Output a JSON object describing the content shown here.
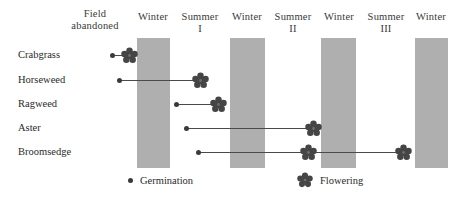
{
  "figure": {
    "background_color": "#ffffff",
    "winter_bar_color": "#a8a8a8",
    "marker_color": "#3a3a3a"
  },
  "columns": [
    {
      "label": "Field\nabandoned",
      "center_x": 95,
      "top": 8,
      "shaded": false
    },
    {
      "label": "Winter",
      "center_x": 153,
      "top": 11,
      "shaded": true
    },
    {
      "label": "Summer\nI",
      "center_x": 200,
      "top": 11,
      "shaded": false
    },
    {
      "label": "Winter",
      "center_x": 247,
      "top": 11,
      "shaded": true
    },
    {
      "label": "Summer\nII",
      "center_x": 293,
      "top": 11,
      "shaded": false
    },
    {
      "label": "Winter",
      "center_x": 339,
      "top": 11,
      "shaded": true
    },
    {
      "label": "Summer\nIII",
      "center_x": 386,
      "top": 11,
      "shaded": false
    },
    {
      "label": "Winter",
      "center_x": 431,
      "top": 11,
      "shaded": true
    }
  ],
  "winter_bars": [
    {
      "name": "winter-1",
      "x": 137,
      "y": 38,
      "width": 33,
      "height": 130
    },
    {
      "name": "winter-2",
      "x": 230,
      "y": 38,
      "width": 35,
      "height": 130
    },
    {
      "name": "winter-3",
      "x": 321,
      "y": 38,
      "width": 35,
      "height": 130
    },
    {
      "name": "winter-4",
      "x": 415,
      "y": 38,
      "width": 33,
      "height": 130
    }
  ],
  "rows": [
    {
      "species": "Crabgrass",
      "label_x": 18,
      "row_y": 55,
      "germination_x": 112,
      "flowering_x": [
        129
      ],
      "track_start": 112,
      "track_end": 129
    },
    {
      "species": "Horseweed",
      "label_x": 18,
      "row_y": 80,
      "germination_x": 119,
      "flowering_x": [
        200
      ],
      "track_start": 119,
      "track_end": 200
    },
    {
      "species": "Ragweed",
      "label_x": 18,
      "row_y": 104,
      "germination_x": 176,
      "flowering_x": [
        218
      ],
      "track_start": 176,
      "track_end": 218
    },
    {
      "species": "Aster",
      "label_x": 18,
      "row_y": 128,
      "germination_x": 186,
      "flowering_x": [
        313
      ],
      "track_start": 186,
      "track_end": 313
    },
    {
      "species": "Broomsedge",
      "label_x": 18,
      "row_y": 152,
      "germination_x": 198,
      "flowering_x": [
        308,
        403
      ],
      "track_start": 198,
      "track_end": 403
    }
  ],
  "legend": {
    "germination": {
      "label": "Germination",
      "x": 128,
      "y": 175
    },
    "flowering": {
      "label": "Flowering",
      "x": 297,
      "y": 172
    }
  },
  "chart_data": {
    "type": "table",
    "xlabel": "",
    "ylabel": "",
    "x_categories": [
      "Field abandoned",
      "Winter",
      "Summer I",
      "Winter",
      "Summer II",
      "Winter",
      "Summer III",
      "Winter"
    ],
    "categories": [
      "Crabgrass",
      "Horseweed",
      "Ragweed",
      "Aster",
      "Broomsedge"
    ],
    "legend": [
      "Germination",
      "Flowering"
    ],
    "legend_position": "bottom",
    "grid": false,
    "series": [
      {
        "name": "Crabgrass",
        "germination": "Field abandoned",
        "flowering": [
          "Field abandoned"
        ]
      },
      {
        "name": "Horseweed",
        "germination": "Field abandoned",
        "flowering": [
          "Summer I"
        ]
      },
      {
        "name": "Ragweed",
        "germination": "Summer I",
        "flowering": [
          "Summer I"
        ]
      },
      {
        "name": "Aster",
        "germination": "Summer I",
        "flowering": [
          "Summer II"
        ]
      },
      {
        "name": "Broomsedge",
        "germination": "Summer I",
        "flowering": [
          "Summer II",
          "Summer III"
        ]
      }
    ]
  }
}
